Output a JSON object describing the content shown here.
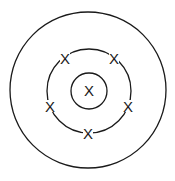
{
  "diagram": {
    "type": "electron-shell",
    "center": {
      "x": 88,
      "y": 90
    },
    "shells": [
      {
        "name": "outer-shell",
        "r": 78
      },
      {
        "name": "middle-shell",
        "r": 42
      },
      {
        "name": "inner-shell",
        "r": 18
      }
    ],
    "marks": [
      {
        "label": "X",
        "x": 89,
        "y": 90,
        "position": "inner"
      },
      {
        "label": "X",
        "x": 65,
        "y": 58,
        "position": "middle-top-left"
      },
      {
        "label": "X",
        "x": 114,
        "y": 58,
        "position": "middle-top-right"
      },
      {
        "label": "X",
        "x": 50,
        "y": 106,
        "position": "middle-left"
      },
      {
        "label": "X",
        "x": 128,
        "y": 106,
        "position": "middle-right"
      },
      {
        "label": "X",
        "x": 88,
        "y": 133,
        "position": "middle-bottom"
      }
    ]
  }
}
